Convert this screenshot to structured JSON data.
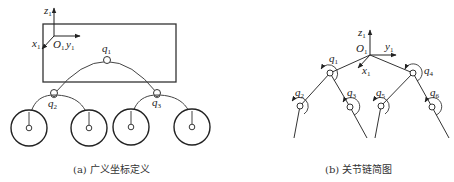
{
  "panel_a": {
    "caption": "(a) 广义坐标定义",
    "frame": {
      "origin": "O",
      "origin_sub": "1",
      "x": "x",
      "x_sub": "1",
      "y": "y",
      "y_sub": "1",
      "z": "z",
      "z_sub": "1"
    },
    "joints": [
      {
        "label": "q",
        "sub": "1"
      },
      {
        "label": "q",
        "sub": "2"
      },
      {
        "label": "q",
        "sub": "3"
      }
    ],
    "wheel_count": 4
  },
  "panel_b": {
    "caption": "(b) 关节链简图",
    "frame": {
      "origin": "O",
      "origin_sub": "1",
      "x": "x",
      "x_sub": "1",
      "y": "y",
      "y_sub": "1",
      "z": "z",
      "z_sub": "1"
    },
    "joints": [
      {
        "label": "q",
        "sub": "1"
      },
      {
        "label": "q",
        "sub": "2"
      },
      {
        "label": "q",
        "sub": "3"
      },
      {
        "label": "q",
        "sub": "4"
      },
      {
        "label": "q",
        "sub": "5"
      },
      {
        "label": "q",
        "sub": "6"
      }
    ]
  },
  "colors": {
    "line": "#333333",
    "background": "#ffffff"
  }
}
